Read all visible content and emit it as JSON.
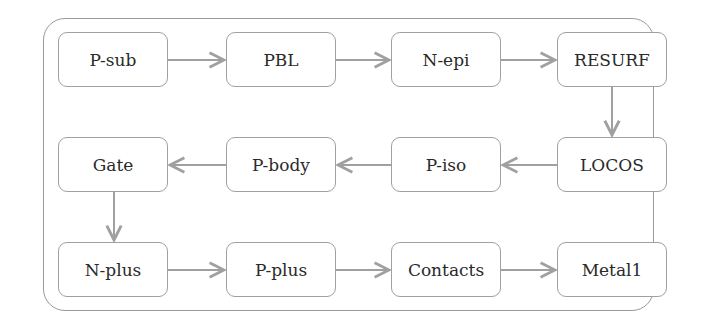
{
  "diagram": {
    "type": "process-flow",
    "colors": {
      "stroke": "#a0a0a0",
      "text": "#2a2a2a",
      "background": "#ffffff"
    },
    "nodes": [
      {
        "id": "p-sub",
        "label": "P-sub"
      },
      {
        "id": "pbl",
        "label": "PBL"
      },
      {
        "id": "n-epi",
        "label": "N-epi"
      },
      {
        "id": "resurf",
        "label": "RESURF"
      },
      {
        "id": "locos",
        "label": "LOCOS"
      },
      {
        "id": "p-iso",
        "label": "P-iso"
      },
      {
        "id": "p-body",
        "label": "P-body"
      },
      {
        "id": "gate",
        "label": "Gate"
      },
      {
        "id": "n-plus",
        "label": "N-plus"
      },
      {
        "id": "p-plus",
        "label": "P-plus"
      },
      {
        "id": "contacts",
        "label": "Contacts"
      },
      {
        "id": "metal1",
        "label": "Metal1"
      }
    ],
    "edges": [
      [
        "P-sub",
        "PBL"
      ],
      [
        "PBL",
        "N-epi"
      ],
      [
        "N-epi",
        "RESURF"
      ],
      [
        "RESURF",
        "LOCOS"
      ],
      [
        "LOCOS",
        "P-iso"
      ],
      [
        "P-iso",
        "P-body"
      ],
      [
        "P-body",
        "Gate"
      ],
      [
        "Gate",
        "N-plus"
      ],
      [
        "N-plus",
        "P-plus"
      ],
      [
        "P-plus",
        "Contacts"
      ],
      [
        "Contacts",
        "Metal1"
      ]
    ]
  }
}
